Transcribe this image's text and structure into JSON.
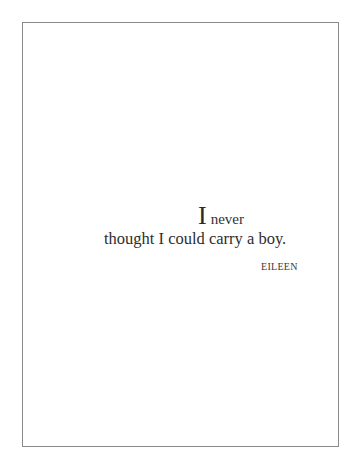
{
  "quote": {
    "drop_cap": "I",
    "first_line_rest": "never",
    "second_line": "thought I could carry a boy.",
    "attribution": "EILEEN"
  },
  "colors": {
    "background": "#ffffff",
    "frame_border": "#8a8a8a",
    "text": "#2a2a2a"
  }
}
